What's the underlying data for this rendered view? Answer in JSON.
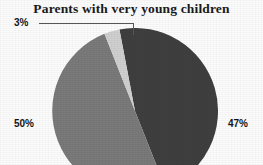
{
  "chart_data": {
    "type": "pie",
    "title": "Parents with very young children",
    "xlabel": "",
    "ylabel": "",
    "grid": false,
    "legend": "none",
    "labels_shown_as": "percent-callouts",
    "start_angle_deg": 0,
    "direction": "clockwise",
    "categories": [
      "47%",
      "50%",
      "3%"
    ],
    "values": [
      47,
      50,
      3
    ],
    "slices": [
      {
        "label": "47%",
        "value": 47,
        "color": "#3f3f3f",
        "label_position": "right-outside"
      },
      {
        "label": "50%",
        "value": 50,
        "color": "#7a7a7a",
        "label_position": "left-outside"
      },
      {
        "label": "3%",
        "value": 3,
        "color": "#d0d0d0",
        "label_position": "top-left-callout",
        "has_leader_line": true
      }
    ]
  },
  "title": {
    "text": "Parents with very young children"
  },
  "labels": {
    "small_slice": "3%",
    "left_slice": "50%",
    "right_slice": "47%"
  },
  "colors": {
    "slice_dark": "#3f3f3f",
    "slice_medium": "#7a7a7a",
    "slice_light": "#d0d0d0",
    "leader_line": "#585858",
    "text": "#151515",
    "background": "#fdfdfd"
  },
  "geometry": {
    "center_x": 135,
    "center_y": 128,
    "radius": 83
  }
}
